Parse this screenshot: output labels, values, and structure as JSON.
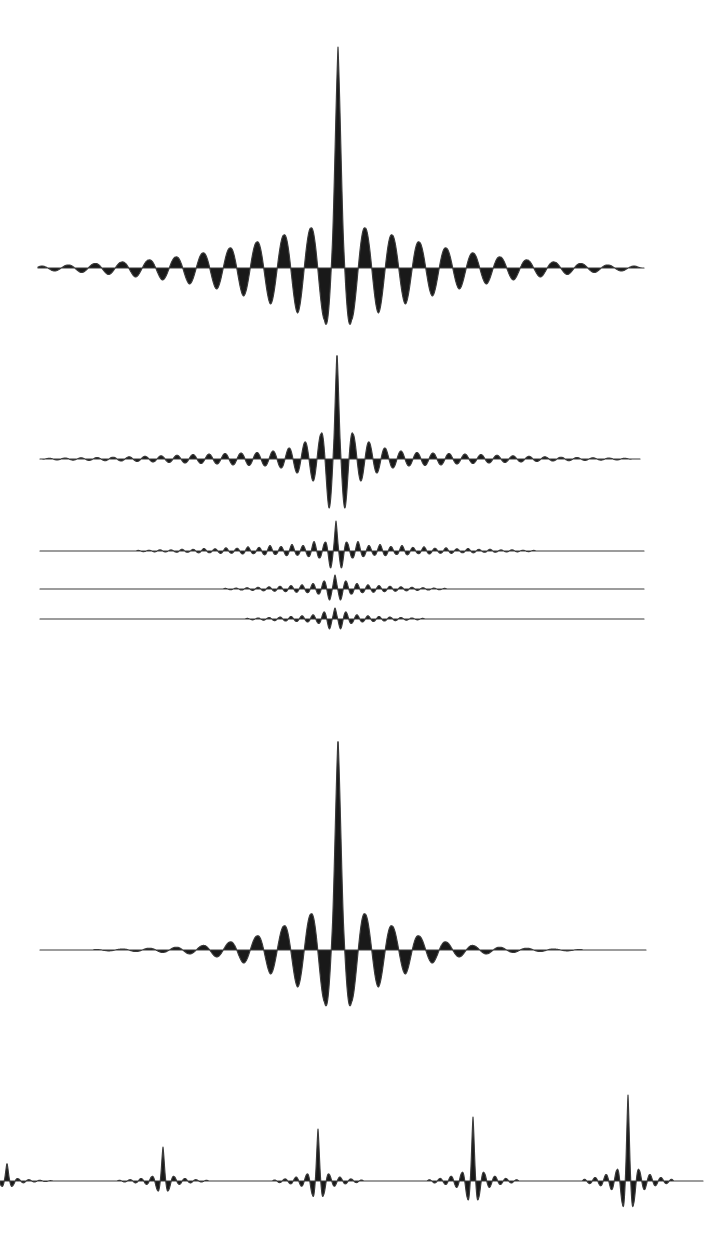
{
  "figure": {
    "kind": "scanned-book-figure",
    "background_color": "#ffffff",
    "ink_fill_color": "#191919",
    "ink_stroke_color": "#3a3a3a",
    "stroke_width": 1.15
  },
  "chart_data": {
    "type": "line",
    "title": "",
    "xlabel": "",
    "ylabel": "",
    "grid": false,
    "legend": false,
    "canvas": {
      "width": 721,
      "height": 1233,
      "units": "pixels"
    },
    "sample_step": 0.4,
    "traces": [
      {
        "name": "interferogram-large-wide-tails",
        "kind": "burst",
        "baseline_y": 268,
        "x_start": 38,
        "x_end": 644,
        "center_x": 338,
        "period": 27,
        "peak": 221,
        "shoulder": 95,
        "downs": [
          52,
          45,
          36,
          28,
          21,
          16,
          12,
          9,
          6.5,
          4.5,
          3
        ],
        "ups": [
          40,
          33,
          26,
          20,
          15,
          11,
          8,
          6,
          4.5,
          3,
          2
        ],
        "extent": 305
      },
      {
        "name": "interferogram-medium",
        "kind": "burst",
        "baseline_y": 459,
        "x_start": 40,
        "x_end": 640,
        "center_x": 337,
        "period": 16,
        "peak": 107,
        "shoulder": 52,
        "downs": [
          49,
          22,
          14,
          9,
          7,
          6.5,
          6,
          5,
          4.5,
          4,
          3.5,
          3,
          2.5,
          2,
          1.7,
          1.4,
          1.1,
          0.9
        ],
        "ups": [
          25,
          17,
          11,
          8,
          6.5,
          6,
          5.5,
          5,
          4.5,
          3.8,
          3.2,
          2.7,
          2.2,
          1.8,
          1.5,
          1.2,
          1,
          0.8
        ],
        "extent": 295
      },
      {
        "name": "interferogram-small-1",
        "kind": "burst",
        "baseline_y": 551,
        "x_start": 40,
        "x_end": 644,
        "center_x": 336,
        "period": 11,
        "peak": 30,
        "shoulder": 16,
        "downs": [
          17,
          7,
          5.5,
          4.2,
          4.6,
          3.4,
          3.8,
          2.6,
          3,
          2.2,
          2.4,
          1.7,
          1.8,
          1.2,
          1.2,
          0.9,
          0.8,
          0.6
        ],
        "ups": [
          8.5,
          9.5,
          5.5,
          6.5,
          4.5,
          5.5,
          3.6,
          4.2,
          2.8,
          3.2,
          2.2,
          2.5,
          1.6,
          1.8,
          1.1,
          1.2,
          0.7,
          0.6
        ],
        "extent": 200
      },
      {
        "name": "interferogram-small-2",
        "kind": "burst",
        "baseline_y": 589,
        "x_start": 40,
        "x_end": 644,
        "center_x": 335,
        "period": 11,
        "peak": 14,
        "shoulder": 9,
        "downs": [
          11,
          5,
          3.6,
          3.2,
          2.6,
          2.2,
          1.8,
          1.4,
          1,
          0.7
        ],
        "ups": [
          8,
          5.5,
          4.2,
          3.4,
          2.8,
          2.2,
          1.7,
          1.3,
          0.9,
          0.6
        ],
        "extent": 112
      },
      {
        "name": "interferogram-small-3",
        "kind": "burst",
        "baseline_y": 619,
        "x_start": 40,
        "x_end": 644,
        "center_x": 335,
        "period": 11,
        "peak": 11,
        "shoulder": 7,
        "downs": [
          10,
          4.4,
          3,
          2.4,
          2,
          1.6,
          1.2,
          0.8
        ],
        "ups": [
          7,
          4.2,
          3.2,
          2.5,
          2,
          1.5,
          1,
          0.6
        ],
        "extent": 90
      },
      {
        "name": "interferogram-large-clean",
        "kind": "burst",
        "baseline_y": 950,
        "x_start": 40,
        "x_end": 646,
        "center_x": 338,
        "period": 27,
        "peak": 213,
        "shoulder": 92,
        "downs": [
          52,
          37,
          24,
          13,
          7,
          4,
          2.5,
          1.5,
          0.8
        ],
        "ups": [
          36,
          24,
          14,
          8,
          4.5,
          2.8,
          1.8,
          1,
          0.5
        ],
        "extent": 245
      },
      {
        "name": "spike-train",
        "kind": "train",
        "baseline_y": 1181,
        "x_start": 0,
        "x_end": 703,
        "period": 11,
        "profile": {
          "peak": 1,
          "shoulder": 0.52,
          "downs": [
            0.27,
            0.1,
            0.055,
            0.03
          ],
          "ups": [
            0.13,
            0.075,
            0.04,
            0.02
          ],
          "extent": 46
        },
        "spikes": [
          {
            "x": 7,
            "height": 18
          },
          {
            "x": 163,
            "height": 34
          },
          {
            "x": 318,
            "height": 52
          },
          {
            "x": 473,
            "height": 64
          },
          {
            "x": 628,
            "height": 86
          }
        ],
        "spike_spacing": 155
      }
    ]
  }
}
